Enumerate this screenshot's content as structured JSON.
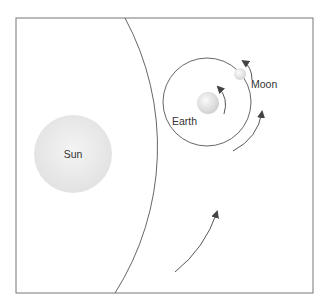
{
  "diagram": {
    "type": "orbit-diagram",
    "labels": {
      "sun": "Sun",
      "earth": "Earth",
      "moon": "Moon"
    },
    "colors": {
      "frame": "#777777",
      "line": "#555555",
      "arrow": "#444444",
      "sun_fill": "#e9e9e9",
      "earth_fill": "#dcdcdc",
      "moon_fill": "#dedede",
      "text": "#333333"
    },
    "elements": [
      {
        "id": "sun",
        "shape": "circle",
        "label": "Sun"
      },
      {
        "id": "earth-orbit",
        "shape": "arc",
        "description": "Earth's orbit around the Sun"
      },
      {
        "id": "earth",
        "shape": "circle",
        "label": "Earth"
      },
      {
        "id": "moon-orbit",
        "shape": "circle",
        "description": "Moon's orbit around Earth"
      },
      {
        "id": "moon",
        "shape": "circle",
        "label": "Moon"
      },
      {
        "id": "earth-rotation-arrow",
        "shape": "arrow",
        "direction": "counterclockwise"
      },
      {
        "id": "moon-orbit-arrow",
        "shape": "arrow",
        "direction": "counterclockwise"
      },
      {
        "id": "earth-orbit-arrow-upper",
        "shape": "arrow",
        "direction": "counterclockwise"
      },
      {
        "id": "earth-orbit-arrow-lower",
        "shape": "arrow",
        "direction": "counterclockwise"
      }
    ]
  }
}
